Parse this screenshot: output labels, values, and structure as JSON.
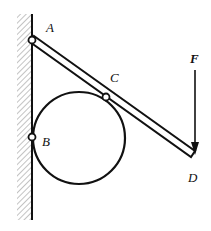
{
  "diagram": {
    "type": "statics-mechanism",
    "labels": {
      "A": "A",
      "B": "B",
      "C": "C",
      "D": "D",
      "F": "F"
    },
    "colors": {
      "stroke": "#111111",
      "hatch": "#777777",
      "background": "#ffffff"
    },
    "elements": {
      "wall": "fixed wall with hatching",
      "bar": "rigid bar AD",
      "disc": "circular disc",
      "pins": [
        "A",
        "B",
        "C"
      ],
      "force": "F (downward at D)"
    }
  }
}
